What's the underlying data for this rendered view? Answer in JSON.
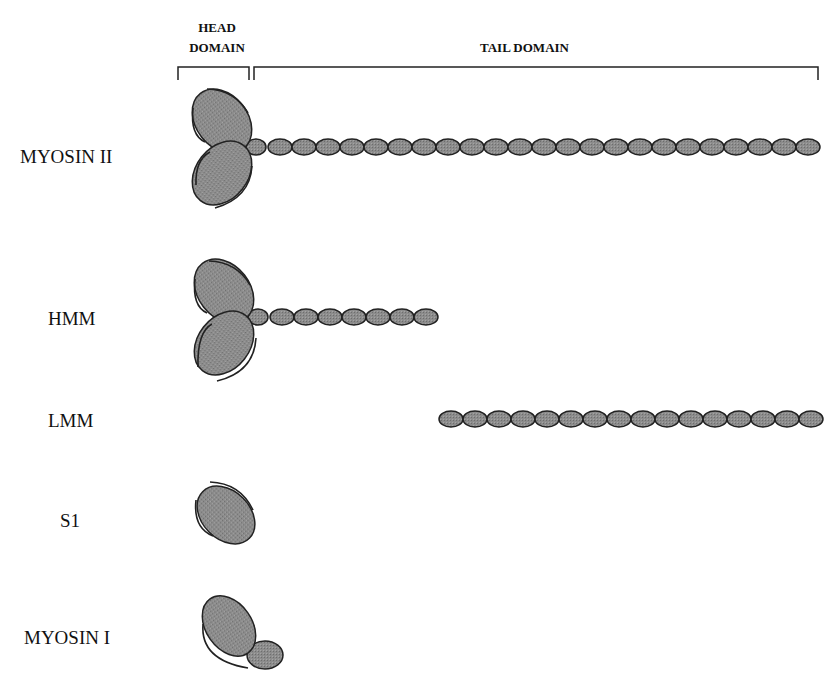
{
  "header": {
    "head_domain_line1": "HEAD",
    "head_domain_line2": "DOMAIN",
    "tail_domain": "TAIL DOMAIN"
  },
  "rows": [
    {
      "label": "MYOSIN II",
      "heads": 2,
      "tail_beads": 24
    },
    {
      "label": "HMM",
      "heads": 2,
      "tail_beads": 8
    },
    {
      "label": "LMM",
      "heads": 0,
      "tail_beads": 16
    },
    {
      "label": "S1",
      "heads": 1,
      "tail_beads": 0
    },
    {
      "label": "MYOSIN I",
      "heads": 1,
      "tail_beads": 0,
      "extra": "light-chain-domain"
    }
  ],
  "colors": {
    "fill": "#8a8a8a",
    "stroke": "#222222",
    "text": "#111111"
  }
}
